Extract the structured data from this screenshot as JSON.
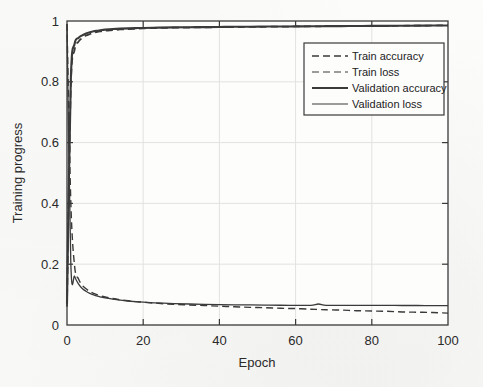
{
  "figure": {
    "background_color": "#fbfbf9",
    "axes_color": "#3a3a3a",
    "grid_color": "#e2e2e0",
    "text_color": "#2a2a2a"
  },
  "chart_data": {
    "type": "line",
    "title": "",
    "xlabel": "Epoch",
    "ylabel": "Training progress",
    "xlim": [
      0,
      100
    ],
    "ylim": [
      0,
      1
    ],
    "xticks": [
      0,
      20,
      40,
      60,
      80,
      100
    ],
    "yticks": [
      0,
      0.2,
      0.4,
      0.6,
      0.8,
      1
    ],
    "xtick_labels": [
      "0",
      "20",
      "40",
      "60",
      "80",
      "100"
    ],
    "ytick_labels": [
      "0",
      "0.2",
      "0.4",
      "0.6",
      "0.8",
      "1"
    ],
    "grid": true,
    "legend_position": "upper right",
    "x": [
      0,
      1,
      2,
      3,
      4,
      5,
      6,
      7,
      8,
      9,
      10,
      12,
      14,
      16,
      18,
      20,
      24,
      28,
      32,
      36,
      40,
      44,
      48,
      52,
      56,
      60,
      64,
      66,
      68,
      72,
      76,
      80,
      84,
      88,
      92,
      96,
      100
    ],
    "series": [
      {
        "name": "Train accuracy",
        "style": "dashed",
        "color": "#3a3a3a",
        "values": [
          0.06,
          0.78,
          0.905,
          0.932,
          0.944,
          0.952,
          0.957,
          0.961,
          0.964,
          0.966,
          0.968,
          0.97,
          0.972,
          0.9735,
          0.9745,
          0.9755,
          0.977,
          0.978,
          0.9785,
          0.979,
          0.9795,
          0.98,
          0.9805,
          0.981,
          0.9815,
          0.982,
          0.9823,
          0.9825,
          0.9828,
          0.983,
          0.9833,
          0.9836,
          0.984,
          0.9844,
          0.9848,
          0.9852,
          0.9856
        ]
      },
      {
        "name": "Train loss",
        "style": "dashed",
        "color": "#3a3a3a",
        "values": [
          0.99,
          0.405,
          0.193,
          0.152,
          0.131,
          0.119,
          0.11,
          0.104,
          0.099,
          0.095,
          0.092,
          0.087,
          0.083,
          0.08,
          0.077,
          0.075,
          0.071,
          0.068,
          0.066,
          0.064,
          0.062,
          0.06,
          0.058,
          0.057,
          0.055,
          0.054,
          0.052,
          0.051,
          0.05,
          0.049,
          0.047,
          0.046,
          0.045,
          0.043,
          0.042,
          0.041,
          0.039
        ]
      },
      {
        "name": "Validation accuracy",
        "style": "solid",
        "color": "#3a3a3a",
        "values": [
          0.07,
          0.805,
          0.925,
          0.944,
          0.953,
          0.959,
          0.963,
          0.966,
          0.968,
          0.97,
          0.9715,
          0.9735,
          0.9748,
          0.9757,
          0.9765,
          0.9772,
          0.9782,
          0.979,
          0.9795,
          0.98,
          0.9805,
          0.981,
          0.9813,
          0.9817,
          0.982,
          0.9823,
          0.9826,
          0.9828,
          0.983,
          0.9832,
          0.9835,
          0.9838,
          0.9841,
          0.9844,
          0.9847,
          0.985,
          0.9853
        ]
      },
      {
        "name": "Validation loss",
        "style": "solid",
        "color": "#3a3a3a",
        "values": [
          0.99,
          0.205,
          0.16,
          0.135,
          0.12,
          0.111,
          0.104,
          0.099,
          0.095,
          0.092,
          0.089,
          0.085,
          0.082,
          0.079,
          0.077,
          0.0755,
          0.0725,
          0.0705,
          0.069,
          0.068,
          0.0672,
          0.0665,
          0.066,
          0.0655,
          0.065,
          0.0648,
          0.0646,
          0.069,
          0.0648,
          0.0646,
          0.0645,
          0.0644,
          0.0643,
          0.0642,
          0.0641,
          0.064,
          0.0639
        ]
      }
    ],
    "legend": [
      {
        "label": "Train accuracy",
        "style": "dashed",
        "width": 1.6
      },
      {
        "label": "Train loss",
        "style": "dashed",
        "width": 1.2
      },
      {
        "label": "Validation accuracy",
        "style": "solid",
        "width": 2.2
      },
      {
        "label": "Validation loss",
        "style": "solid",
        "width": 1.2
      }
    ]
  }
}
